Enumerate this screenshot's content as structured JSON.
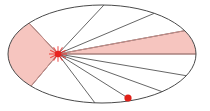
{
  "figure": {
    "background_color": "#ffffff",
    "width": 210,
    "height": 111
  },
  "colors": {
    "outline": "#4a4a4a",
    "chord": "#555555",
    "shade_fill": "#f6c5bf",
    "shade_stroke": "#c98e89",
    "marker_red": "#e8231f",
    "dot_red": "#e02018",
    "background": "#ffffff"
  },
  "ellipse": {
    "name": "bounding-ellipse",
    "cx": 102,
    "cy": 54,
    "rx": 94,
    "ry": 49,
    "stroke_width": 1
  },
  "vertex": {
    "name": "apex-point",
    "x": 58,
    "y": 54,
    "marker": "star-asterisk",
    "size": 9
  },
  "free_point": {
    "name": "boundary-dot",
    "x": 128,
    "y": 98,
    "marker": "filled-circle",
    "radius": 3.6
  },
  "shaded_wedges": [
    {
      "name": "left-wedge",
      "label": "left shaded sector",
      "points": "58,54 28,22 10,42 10,66 32,85",
      "fill": "#f6c5bf"
    },
    {
      "name": "right-wedge",
      "label": "right shaded sector",
      "points": "58,54 183,31 196,54",
      "fill": "#f6c5bf"
    }
  ],
  "chords": [
    {
      "name": "chord-upper-left",
      "x1": 58,
      "y1": 54,
      "x2": 28,
      "y2": 22
    },
    {
      "name": "chord-up-steep",
      "x1": 58,
      "y1": 54,
      "x2": 103,
      "y2": 6
    },
    {
      "name": "chord-up-right-1",
      "x1": 58,
      "y1": 54,
      "x2": 155,
      "y2": 13
    },
    {
      "name": "chord-up-right-2",
      "x1": 58,
      "y1": 54,
      "x2": 183,
      "y2": 31
    },
    {
      "name": "chord-horizontal",
      "x1": 58,
      "y1": 54,
      "x2": 196,
      "y2": 54
    },
    {
      "name": "chord-down-right-1",
      "x1": 58,
      "y1": 54,
      "x2": 188,
      "y2": 76
    },
    {
      "name": "chord-down-right-2",
      "x1": 58,
      "y1": 54,
      "x2": 163,
      "y2": 92
    },
    {
      "name": "chord-down-right-3",
      "x1": 58,
      "y1": 54,
      "x2": 128,
      "y2": 98
    },
    {
      "name": "chord-down-left",
      "x1": 58,
      "y1": 54,
      "x2": 95,
      "y2": 103
    },
    {
      "name": "chord-lower-left",
      "x1": 58,
      "y1": 54,
      "x2": 32,
      "y2": 85
    }
  ],
  "wedge_edges": [
    {
      "name": "wedge-edge-left-upper",
      "x1": 58,
      "y1": 54,
      "x2": 28,
      "y2": 22
    },
    {
      "name": "wedge-edge-left-lower",
      "x1": 58,
      "y1": 54,
      "x2": 32,
      "y2": 85
    },
    {
      "name": "wedge-edge-right-upper",
      "x1": 58,
      "y1": 54,
      "x2": 183,
      "y2": 31
    },
    {
      "name": "wedge-edge-right-lower",
      "x1": 58,
      "y1": 54,
      "x2": 196,
      "y2": 54
    }
  ]
}
